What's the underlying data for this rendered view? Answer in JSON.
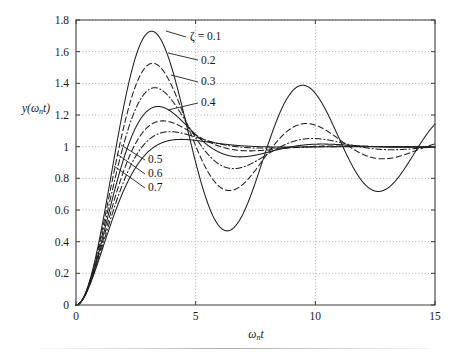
{
  "chart_data": {
    "type": "line",
    "title": "",
    "xlabel": "ωₙt",
    "ylabel": "y(ωₙt)",
    "xlim": [
      0,
      15
    ],
    "ylim": [
      0,
      1.8
    ],
    "xticks": [
      "0",
      "5",
      "10",
      "15"
    ],
    "xtick_values": [
      0,
      5,
      10,
      15
    ],
    "yticks": [
      "0",
      "0.2",
      "0.4",
      "0.6",
      "0.8",
      "1",
      "1.2",
      "1.4",
      "1.6",
      "1.8"
    ],
    "ytick_values": [
      0,
      0.2,
      0.4,
      0.6,
      0.8,
      1.0,
      1.2,
      1.4,
      1.6,
      1.8
    ],
    "grid": true,
    "legend_position": "inline-annotations",
    "formula": "y = 1 - exp(-z*x)/sqrt(1-z^2) * sin(sqrt(1-z^2)*x + acos(z))",
    "series": [
      {
        "name": "ζ = 0.1",
        "zeta": 0.1,
        "style": "solid",
        "peak_value": 1.73,
        "peak_x": 3.16
      },
      {
        "name": "0.2",
        "zeta": 0.2,
        "style": "dashed",
        "peak_value": 1.53,
        "peak_x": 3.21
      },
      {
        "name": "0.3",
        "zeta": 0.3,
        "style": "dashdot",
        "peak_value": 1.37,
        "peak_x": 3.29
      },
      {
        "name": "0.4",
        "zeta": 0.4,
        "style": "solid",
        "peak_value": 1.25,
        "peak_x": 3.43
      },
      {
        "name": "0.5",
        "zeta": 0.5,
        "style": "dashed",
        "peak_value": 1.16,
        "peak_x": 3.63
      },
      {
        "name": "0.6",
        "zeta": 0.6,
        "style": "dashdot",
        "peak_value": 1.09,
        "peak_x": 3.93
      },
      {
        "name": "0.7",
        "zeta": 0.7,
        "style": "solid",
        "peak_value": 1.05,
        "peak_x": 4.4
      }
    ],
    "annotations": [
      {
        "label": "ζ = 0.1",
        "text_x": 190,
        "text_y": 40,
        "leader": [
          [
            186,
            37
          ],
          [
            166,
            31
          ]
        ]
      },
      {
        "label": "0.2",
        "text_x": 201,
        "text_y": 64,
        "leader": [
          [
            198,
            60
          ],
          [
            168,
            53
          ]
        ]
      },
      {
        "label": "0.3",
        "text_x": 201,
        "text_y": 85,
        "leader": [
          [
            198,
            82
          ],
          [
            171,
            75
          ]
        ]
      },
      {
        "label": "0.4",
        "text_x": 201,
        "text_y": 106,
        "leader": [
          [
            198,
            103
          ],
          [
            168,
            110
          ]
        ]
      },
      {
        "label": "0.5",
        "text_x": 148,
        "text_y": 163,
        "leader": [
          [
            145,
            160
          ],
          [
            121,
            145
          ]
        ]
      },
      {
        "label": "0.6",
        "text_x": 148,
        "text_y": 177,
        "leader": [
          [
            145,
            174
          ],
          [
            117,
            154
          ]
        ]
      },
      {
        "label": "0.7",
        "text_x": 148,
        "text_y": 191,
        "leader": [
          [
            145,
            188
          ],
          [
            114,
            166
          ]
        ]
      }
    ]
  }
}
